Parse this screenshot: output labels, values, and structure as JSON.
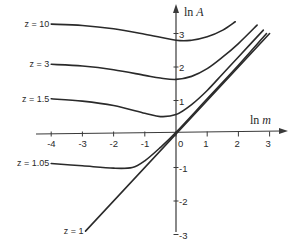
{
  "chart_data": {
    "type": "line",
    "title": "",
    "xlabel": "ln m",
    "ylabel": "ln A",
    "xlim": [
      -4.2,
      3.6
    ],
    "ylim": [
      -3.2,
      3.6
    ],
    "grid": false,
    "legend": "inline labels at left end of curves",
    "x_ticks": [
      "-4",
      "-3",
      "-2",
      "-1",
      "0",
      "1",
      "2",
      "3"
    ],
    "y_ticks": [
      "3",
      "2",
      "1",
      "-1",
      "-2",
      "-3"
    ],
    "series": [
      {
        "name": "z = 10",
        "x": [
          -4.0,
          -3.0,
          -2.0,
          -1.0,
          0.0,
          0.5,
          1.0,
          1.5,
          1.9
        ],
        "y": [
          3.28,
          3.24,
          3.14,
          2.98,
          2.8,
          2.8,
          2.9,
          3.1,
          3.35
        ]
      },
      {
        "name": "z = 3",
        "x": [
          -4.0,
          -3.0,
          -2.0,
          -1.0,
          -0.5,
          0.0,
          0.5,
          1.0,
          1.5,
          2.0,
          2.6
        ],
        "y": [
          2.08,
          2.03,
          1.92,
          1.75,
          1.67,
          1.63,
          1.72,
          1.95,
          2.3,
          2.7,
          3.25
        ]
      },
      {
        "name": "z = 1.5",
        "x": [
          -4.0,
          -3.0,
          -2.0,
          -1.0,
          -0.5,
          0.0,
          0.5,
          1.0,
          1.5,
          2.0,
          2.8
        ],
        "y": [
          1.05,
          0.98,
          0.85,
          0.62,
          0.52,
          0.58,
          0.88,
          1.3,
          1.8,
          2.3,
          3.1
        ]
      },
      {
        "name": "z = 1.05",
        "x": [
          -4.0,
          -3.0,
          -2.0,
          -1.4,
          -1.0,
          -0.5,
          0.0,
          1.0,
          2.0,
          2.9
        ],
        "y": [
          -0.88,
          -0.95,
          -1.02,
          -1.0,
          -0.8,
          -0.4,
          0.05,
          1.05,
          2.05,
          3.0
        ]
      },
      {
        "name": "z = 1",
        "x": [
          -2.9,
          3.0
        ],
        "y": [
          -2.9,
          3.0
        ]
      }
    ]
  },
  "axes": {
    "x_title_main": "ln ",
    "x_title_var": "m",
    "y_title_main": "ln ",
    "y_title_var": "A"
  }
}
